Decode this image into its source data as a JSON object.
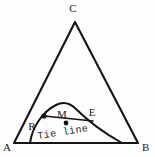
{
  "figure": {
    "kind": "ternary-phase-diagram",
    "background_color": "#fdfdfd",
    "line_color": "#141414"
  },
  "vertices": {
    "apex": {
      "label": "C",
      "x": 75,
      "y": 22,
      "label_x": 73,
      "label_y": 12
    },
    "left": {
      "label": "A",
      "x": 14,
      "y": 143,
      "label_x": 3,
      "label_y": 151
    },
    "right": {
      "label": "B",
      "x": 138,
      "y": 143,
      "label_x": 142,
      "label_y": 151
    }
  },
  "points": [
    {
      "name": "raffinate",
      "label": "R",
      "x": 44,
      "y": 116,
      "label_x": 32,
      "label_y": 130
    },
    {
      "name": "mixture",
      "label": "M",
      "x": 66,
      "y": 123,
      "label_x": 62,
      "label_y": 118
    },
    {
      "name": "extract",
      "label": "E",
      "x": 93,
      "y": 121,
      "label_x": 92,
      "label_y": 116
    }
  ],
  "tie_line": {
    "label": "Tie line",
    "label_x": 38,
    "label_y": 139,
    "label_rotation": -9,
    "from_x": 44,
    "from_y": 116,
    "to_x": 93,
    "to_y": 121
  },
  "binodal_curve": {
    "name": "binodal-curve",
    "path": "M 30,143 C 32,128 42,112 56,105 C 64,101 70,103 76,109 C 86,119 104,133 122,143"
  },
  "triangle": {
    "path": "M 14,143 L 75,22 L 138,143 Z"
  },
  "chart_data": {
    "type": "scatter",
    "title": "",
    "xlabel": "",
    "ylabel": "",
    "annotations": [
      "C",
      "A",
      "B",
      "R",
      "M",
      "E",
      "Tie line"
    ],
    "series": [
      {
        "name": "tie-line-points",
        "points": [
          {
            "label": "R",
            "x": 44,
            "y": 116
          },
          {
            "label": "M",
            "x": 66,
            "y": 123
          },
          {
            "label": "E",
            "x": 93,
            "y": 121
          }
        ]
      }
    ],
    "grid": false,
    "legend": "none"
  }
}
